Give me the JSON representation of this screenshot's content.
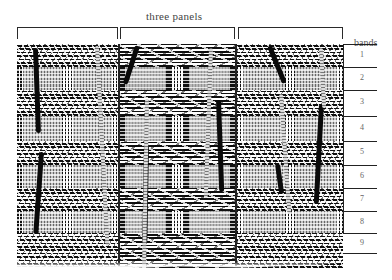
{
  "figure": {
    "title": "three panels",
    "bands_label": "bands",
    "panels": [
      {
        "id": "left",
        "x": 17,
        "width": 101
      },
      {
        "id": "center",
        "x": 120,
        "width": 115
      },
      {
        "id": "right",
        "x": 238,
        "width": 105
      }
    ],
    "bands": [
      {
        "number": "1",
        "type": "plain",
        "y": 44,
        "height": 23
      },
      {
        "number": "2",
        "type": "patterned",
        "y": 67,
        "height": 23
      },
      {
        "number": "3",
        "type": "plain",
        "y": 90,
        "height": 26
      },
      {
        "number": "4",
        "type": "patterned",
        "y": 116,
        "height": 25
      },
      {
        "number": "5",
        "type": "plain",
        "y": 141,
        "height": 24
      },
      {
        "number": "6",
        "type": "patterned",
        "y": 165,
        "height": 23
      },
      {
        "number": "7",
        "type": "plain",
        "y": 188,
        "height": 23
      },
      {
        "number": "8",
        "type": "patterned",
        "y": 211,
        "height": 22
      },
      {
        "number": "9",
        "type": "plain",
        "y": 233,
        "height": 35
      }
    ],
    "colors": {
      "ink": "#111111",
      "paper": "#ffffff",
      "label": "#555555"
    }
  }
}
